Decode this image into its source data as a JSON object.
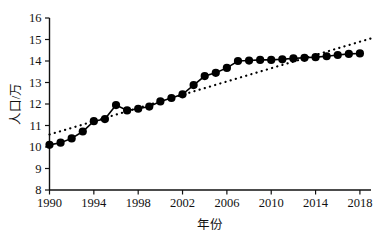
{
  "chart_data": {
    "type": "line",
    "title": "",
    "xlabel": "年份",
    "ylabel": "人口/万",
    "xlim": [
      1990,
      2019
    ],
    "ylim": [
      8,
      16
    ],
    "grid": false,
    "legend": "none",
    "x": [
      1990,
      1991,
      1992,
      1993,
      1994,
      1995,
      1996,
      1997,
      1998,
      1999,
      2000,
      2001,
      2002,
      2003,
      2004,
      2005,
      2006,
      2007,
      2008,
      2009,
      2010,
      2011,
      2012,
      2013,
      2014,
      2015,
      2016,
      2017,
      2018
    ],
    "xtick_labels": [
      "1990",
      "1994",
      "1998",
      "2002",
      "2006",
      "2010",
      "2014",
      "2018"
    ],
    "xtick_values": [
      1990,
      1994,
      1998,
      2002,
      2006,
      2010,
      2014,
      2018
    ],
    "ytick_labels": [
      "8",
      "9",
      "10",
      "11",
      "12",
      "13",
      "14",
      "15",
      "16"
    ],
    "ytick_values": [
      8,
      9,
      10,
      11,
      12,
      13,
      14,
      15,
      16
    ],
    "series": [
      {
        "name": "人口",
        "style": "line-with-round-markers",
        "color": "#000000",
        "values": [
          10.1,
          10.2,
          10.4,
          10.72,
          11.2,
          11.3,
          11.95,
          11.7,
          11.78,
          11.88,
          12.12,
          12.28,
          12.45,
          12.88,
          13.3,
          13.45,
          13.68,
          14.0,
          14.02,
          14.05,
          14.05,
          14.08,
          14.12,
          14.15,
          14.18,
          14.22,
          14.28,
          14.33,
          14.35
        ]
      },
      {
        "name": "线性趋势线",
        "style": "dotted-trendline",
        "color": "#000000",
        "x_endpoints": [
          1990,
          2019
        ],
        "y_endpoints": [
          10.58,
          15.05
        ]
      }
    ]
  }
}
